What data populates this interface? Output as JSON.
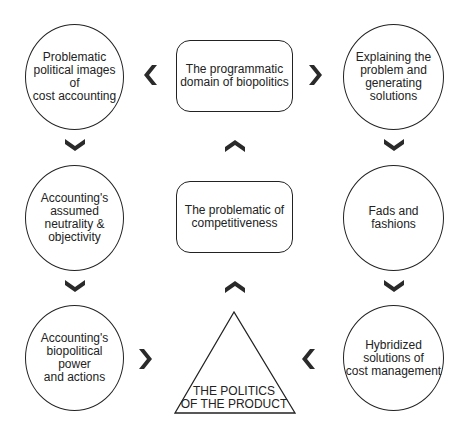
{
  "diagram": {
    "nodes": {
      "top_left": "Problematic\npolitical images\nof\ncost accounting",
      "top_center": "The programmatic\ndomain of  biopolitics",
      "top_right": "Explaining the\nproblem and\ngenerating\nsolutions",
      "mid_left": "Accounting's\nassumed\nneutrality &\nobjectivity",
      "mid_center": "The problematic of\ncompetitiveness",
      "mid_right": "Fads and\nfashions",
      "bot_left": "Accounting's\nbiopolitical\npower\nand actions",
      "bot_center": "THE POLITICS\nOF THE PRODUCT",
      "bot_right": "Hybridized\nsolutions of\ncost management"
    },
    "edges": [
      {
        "from": "top_center",
        "to": "top_left",
        "direction": "left"
      },
      {
        "from": "top_center",
        "to": "top_right",
        "direction": "right"
      },
      {
        "from": "top_left",
        "to": "mid_left",
        "direction": "down"
      },
      {
        "from": "mid_left",
        "to": "bot_left",
        "direction": "down"
      },
      {
        "from": "bot_left",
        "to": "bot_center",
        "direction": "right"
      },
      {
        "from": "top_right",
        "to": "mid_right",
        "direction": "down"
      },
      {
        "from": "mid_right",
        "to": "bot_right",
        "direction": "down"
      },
      {
        "from": "bot_right",
        "to": "bot_center",
        "direction": "left"
      },
      {
        "from": "bot_center",
        "to": "mid_center",
        "direction": "up"
      },
      {
        "from": "mid_center",
        "to": "top_center",
        "direction": "up"
      }
    ],
    "colors": {
      "stroke": "#222222",
      "arrow": "#2a2a2a",
      "background": "#ffffff"
    }
  }
}
